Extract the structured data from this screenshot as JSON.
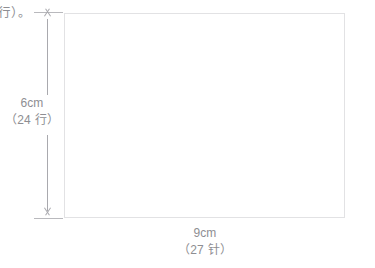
{
  "diagram": {
    "type": "knitting-gauge-swatch-dimension-diagram",
    "runin_text": "行）。",
    "swatch": {
      "label": "",
      "fill_color": "#ffffff",
      "border_color": "#e2e2e4"
    },
    "vertical_dimension": {
      "name": "height",
      "value": "6cm",
      "sub_value": "（24 行）",
      "arrow_style": "double-headed",
      "line_color": "#a9a9ae",
      "tick_color": "#b9b9bd"
    },
    "horizontal_dimension": {
      "name": "width",
      "value": "9cm",
      "sub_value": "（27 针）",
      "arrow_style": "double-headed",
      "line_color": "#a9a9ae",
      "tick_color": "#b9b9bd"
    },
    "text_color": "#8e8e92"
  }
}
